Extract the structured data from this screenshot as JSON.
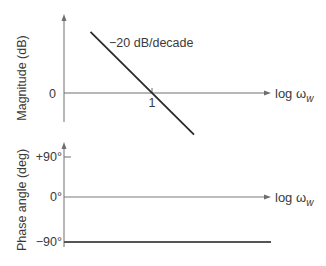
{
  "chart_data": [
    {
      "type": "line",
      "title": "",
      "ylabel": "Magnitude (dB)",
      "xlabel": "log ω",
      "xlabel_subscript": "w",
      "x_ticks": [
        {
          "value": 1,
          "label": "1"
        }
      ],
      "y_ticks": [
        {
          "value": 0,
          "label": "0"
        }
      ],
      "series": [
        {
          "name": "magnitude-asymptote",
          "x": [
            0.2,
            3.0
          ],
          "y": [
            13.98,
            -9.54
          ],
          "slope_label": "−20 dB/decade"
        }
      ],
      "annotations": [
        "−20 dB/decade"
      ],
      "xscale": "log",
      "xlim": [
        0.14,
        10
      ],
      "ylim": [
        -11,
        27
      ],
      "grid": false
    },
    {
      "type": "line",
      "title": "",
      "ylabel": "Phase angle (deg)",
      "xlabel": "log ω",
      "xlabel_subscript": "w",
      "y_ticks": [
        {
          "value": 90,
          "label": "+90°"
        },
        {
          "value": 0,
          "label": "0°"
        },
        {
          "value": -90,
          "label": "−90°"
        }
      ],
      "series": [
        {
          "name": "phase",
          "x": [
            0.14,
            10
          ],
          "y": [
            -90,
            -90
          ]
        }
      ],
      "xscale": "log",
      "xlim": [
        0.14,
        10
      ],
      "ylim": [
        -98,
        117
      ],
      "grid": false
    }
  ]
}
